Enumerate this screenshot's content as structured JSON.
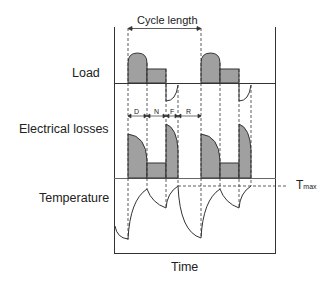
{
  "diagram": {
    "labels": {
      "cycle_length": "Cycle length",
      "load": "Load",
      "electrical_losses": "Electrical losses",
      "temperature": "Temperature",
      "time": "Time",
      "tmax_main": "T",
      "tmax_sub": "max"
    },
    "phases": [
      {
        "key": "D",
        "label": "D"
      },
      {
        "key": "N",
        "label": "N"
      },
      {
        "key": "F",
        "label": "F"
      },
      {
        "key": "R",
        "label": "R"
      }
    ],
    "colors": {
      "fill": "#a0a0a0",
      "stroke": "#333333",
      "text": "#222222"
    }
  }
}
